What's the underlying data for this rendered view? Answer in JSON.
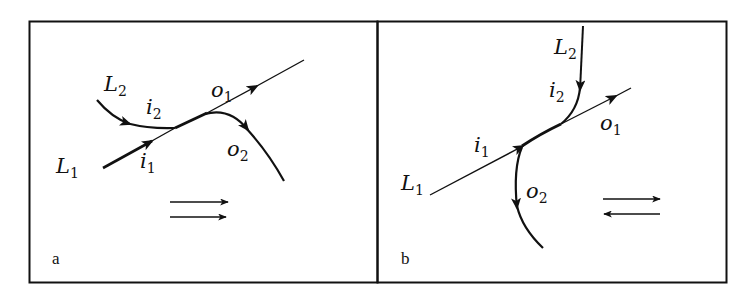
{
  "figure": {
    "panels": [
      {
        "id": "a",
        "panel_label": "a",
        "labels": {
          "L1": {
            "main": "L",
            "sub": "1"
          },
          "L2": {
            "main": "L",
            "sub": "2"
          },
          "i1": {
            "main": "i",
            "sub": "1"
          },
          "i2": {
            "main": "i",
            "sub": "2"
          },
          "o1": {
            "main": "o",
            "sub": "1"
          },
          "o2": {
            "main": "o",
            "sub": "2"
          }
        },
        "direction_symbol": "two parallel arrows pointing right (⇉)"
      },
      {
        "id": "b",
        "panel_label": "b",
        "labels": {
          "L1": {
            "main": "L",
            "sub": "1"
          },
          "L2": {
            "main": "L",
            "sub": "2"
          },
          "i1": {
            "main": "i",
            "sub": "1"
          },
          "i2": {
            "main": "i",
            "sub": "2"
          },
          "o1": {
            "main": "o",
            "sub": "1"
          },
          "o2": {
            "main": "o",
            "sub": "2"
          }
        },
        "direction_symbol": "opposing arrows, top right, bottom left (⇄)"
      }
    ],
    "colors": {
      "stroke": "#111111",
      "background": "#ffffff"
    }
  }
}
